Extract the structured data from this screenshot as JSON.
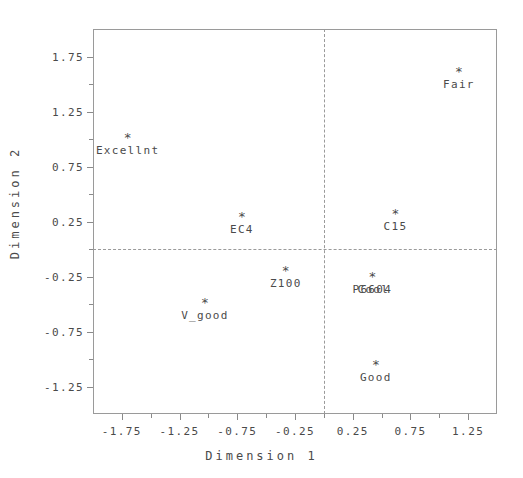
{
  "chart_data": {
    "type": "scatter",
    "title": "",
    "xlabel": "Dimension 1",
    "ylabel": "Dimension 2",
    "xlim": [
      -2.0,
      1.5
    ],
    "ylim": [
      -1.5,
      2.0
    ],
    "xticks": [
      "-1.75",
      "-1.25",
      "-0.75",
      "-0.25",
      "0.25",
      "0.75",
      "1.25"
    ],
    "xtick_values": [
      -1.75,
      -1.25,
      -0.75,
      -0.25,
      0.25,
      0.75,
      1.25
    ],
    "yticks": [
      "1.75",
      "1.25",
      "0.75",
      "0.25",
      "-0.25",
      "-0.75",
      "-1.25"
    ],
    "ytick_values": [
      1.75,
      1.25,
      0.75,
      0.25,
      -0.25,
      -0.75,
      -1.25
    ],
    "x_minor_ticks": [
      -1.5,
      -1.0,
      -0.5,
      0.0,
      0.5,
      1.0
    ],
    "y_minor_ticks": [
      1.5,
      1.0,
      0.5,
      0.0,
      -0.5,
      -1.0
    ],
    "grid": false,
    "legend": "none",
    "reference_lines": {
      "vertical_x": 0.0,
      "horizontal_y": 0.0,
      "style": "dashed"
    },
    "marker": "*",
    "points": [
      {
        "label": "Fair",
        "x": 1.17,
        "y": 1.58
      },
      {
        "label": "Excellnt",
        "x": -1.7,
        "y": 0.98
      },
      {
        "label": "C15",
        "x": 0.62,
        "y": 0.29
      },
      {
        "label": "EC4",
        "x": -0.71,
        "y": 0.26
      },
      {
        "label": "Z100",
        "x": -0.33,
        "y": -0.23
      },
      {
        "label": "P6604",
        "x": 0.42,
        "y": -0.28
      },
      {
        "label": "Cool",
        "x": 0.42,
        "y": -0.28
      },
      {
        "label": "V_good",
        "x": -1.03,
        "y": -0.52
      },
      {
        "label": "Good",
        "x": 0.45,
        "y": -1.08
      }
    ]
  },
  "colors": {
    "frame": "#9a9a9a",
    "text": "#4a4a4a",
    "background": "#ffffff",
    "reference_line": "#9a9a9a"
  }
}
